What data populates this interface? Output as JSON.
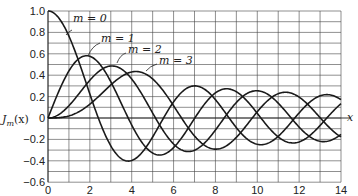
{
  "chart_data": {
    "type": "line",
    "title": "",
    "xlabel": "x",
    "ylabel": "J_m(x)",
    "xlim": [
      0,
      14
    ],
    "ylim": [
      -0.6,
      1.0
    ],
    "grid": true,
    "x_ticks": [
      "0",
      "2",
      "4",
      "6",
      "8",
      "10",
      "12",
      "14"
    ],
    "y_ticks": [
      "1.0",
      "0.8",
      "0.6",
      "0.4",
      "0.2",
      "0",
      "−0.2",
      "−0.4",
      "−0.6"
    ],
    "legend_position": "inline annotations",
    "series": [
      {
        "name": "m = 0",
        "label": "m = 0",
        "function": "J0(x)",
        "x": [
          0,
          1,
          2,
          2.405,
          3,
          3.832,
          4,
          5,
          5.52,
          6,
          7,
          7.016,
          8,
          8.654,
          9,
          10,
          10.17,
          11,
          11.79,
          12,
          13,
          13.32,
          14
        ],
        "y": [
          1.0,
          0.765,
          0.224,
          0.0,
          -0.26,
          -0.403,
          -0.397,
          -0.178,
          0.0,
          0.151,
          0.3,
          0.3,
          0.172,
          0.0,
          -0.09,
          -0.246,
          -0.25,
          -0.171,
          0.0,
          0.048,
          0.207,
          0.218,
          0.171
        ]
      },
      {
        "name": "m = 1",
        "label": "m = 1",
        "function": "J1(x)",
        "x": [
          0,
          1,
          1.841,
          2,
          3,
          3.832,
          4,
          5,
          5.331,
          6,
          7,
          7.016,
          8,
          8.536,
          9,
          10,
          10.17,
          11,
          11.71,
          12,
          13,
          13.32,
          14
        ],
        "y": [
          0.0,
          0.44,
          0.582,
          0.577,
          0.339,
          0.0,
          -0.066,
          -0.328,
          -0.346,
          -0.277,
          -0.005,
          0.0,
          0.235,
          0.273,
          0.245,
          0.043,
          0.0,
          -0.177,
          -0.232,
          -0.223,
          -0.07,
          0.0,
          0.133
        ]
      },
      {
        "name": "m = 2",
        "label": "m = 2",
        "function": "J2(x)",
        "x": [
          0,
          1,
          2,
          3,
          3.054,
          4,
          5,
          5.136,
          6,
          6.706,
          7,
          8,
          8.417,
          9,
          9.969,
          10,
          11,
          11.62,
          12,
          13,
          13.25,
          14
        ],
        "y": [
          0.0,
          0.115,
          0.353,
          0.486,
          0.486,
          0.364,
          0.047,
          0.0,
          -0.243,
          -0.314,
          -0.301,
          -0.113,
          0.0,
          0.145,
          0.272,
          0.255,
          0.139,
          0.0,
          -0.085,
          -0.218,
          -0.228,
          -0.152
        ]
      },
      {
        "name": "m = 3",
        "label": "m = 3",
        "function": "J3(x)",
        "x": [
          0,
          1,
          2,
          3,
          4,
          4.201,
          5,
          6,
          6.38,
          7,
          8,
          8.015,
          9,
          9.761,
          10,
          11,
          11.35,
          12,
          13,
          13.02,
          14
        ],
        "y": [
          0.0,
          0.02,
          0.129,
          0.309,
          0.43,
          0.434,
          0.365,
          0.115,
          0.0,
          -0.168,
          -0.291,
          -0.291,
          -0.181,
          0.0,
          0.058,
          0.227,
          0.244,
          0.195,
          0.0,
          0.0,
          -0.177
        ]
      }
    ],
    "annotations": [
      {
        "text": "m = 0",
        "pointing_to": "J0 near x=0.8"
      },
      {
        "text": "m = 1",
        "pointing_to": "J1 near x=1.9"
      },
      {
        "text": "m = 2",
        "pointing_to": "J2 near x=3.1"
      },
      {
        "text": "m = 3",
        "pointing_to": "J3 near x=4.3"
      }
    ]
  },
  "labels": {
    "ylabel_main": "J",
    "ylabel_sub": "m",
    "ylabel_arg": "(x)",
    "xlabel": "x",
    "m0": "m = 0",
    "m1": "m = 1",
    "m2": "m = 2",
    "m3": "m = 3"
  },
  "colors": {
    "curve": "#1a1a1a",
    "grid": "#444444",
    "background": "#ffffff"
  }
}
